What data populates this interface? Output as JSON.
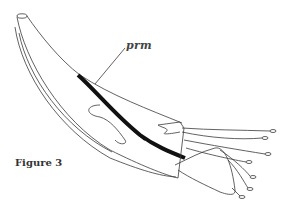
{
  "figure": {
    "caption": "Figure 3",
    "labels": [
      {
        "id": "prm",
        "text": "prm"
      }
    ],
    "colors": {
      "ink": "#3a3a3a",
      "background": "#ffffff"
    }
  }
}
